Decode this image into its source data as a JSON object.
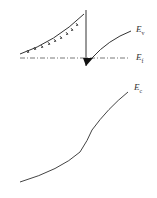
{
  "diagram": {
    "type": "energy-band-diagram",
    "labels": {
      "ev": {
        "main": "E",
        "sub": "v"
      },
      "ef": {
        "main": "E",
        "sub": "f"
      },
      "ec": {
        "main": "E",
        "sub": "c"
      }
    },
    "colors": {
      "line": "#333333",
      "background": "#ffffff"
    }
  }
}
